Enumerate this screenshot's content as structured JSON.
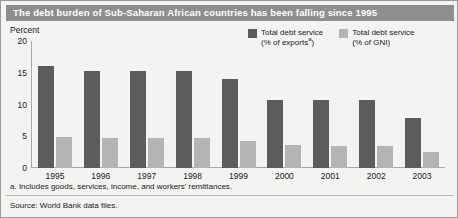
{
  "title": "The debt burden of Sub-Saharan African countries has been falling since 1995",
  "unit_label": "Percent",
  "legend": [
    {
      "label_line1": "Total debt service",
      "label_line2": "(% of exports",
      "footnote_marker": "a",
      "label_line2_end": ")",
      "color": "#5c5c5c",
      "swatch_name": "dark-gray"
    },
    {
      "label_line1": "Total debt service",
      "label_line2": "(% of GNI)",
      "footnote_marker": "",
      "label_line2_end": "",
      "color": "#b4b4b4",
      "swatch_name": "light-gray"
    }
  ],
  "footnote": "a. Includes goods, services, income, and workers' remittances.",
  "source": "Source: World Bank data files.",
  "chart_data": {
    "type": "bar",
    "title": "The debt burden of Sub-Saharan African countries has been falling since 1995",
    "xlabel": "",
    "ylabel": "Percent",
    "ylim": [
      0,
      20
    ],
    "yticks": [
      0,
      5,
      10,
      15,
      20
    ],
    "grid": false,
    "legend_position": "top-right",
    "categories": [
      "1995",
      "1996",
      "1997",
      "1998",
      "1999",
      "2000",
      "2001",
      "2002",
      "2003"
    ],
    "series": [
      {
        "name": "Total debt service (% of exports)",
        "color": "#5c5c5c",
        "values": [
          16.1,
          15.3,
          15.2,
          15.2,
          14.0,
          10.7,
          10.7,
          10.7,
          7.8
        ]
      },
      {
        "name": "Total debt service (% of GNI)",
        "color": "#b4b4b4",
        "values": [
          4.9,
          4.8,
          4.7,
          4.8,
          4.2,
          3.6,
          3.5,
          3.4,
          2.6
        ]
      }
    ]
  }
}
